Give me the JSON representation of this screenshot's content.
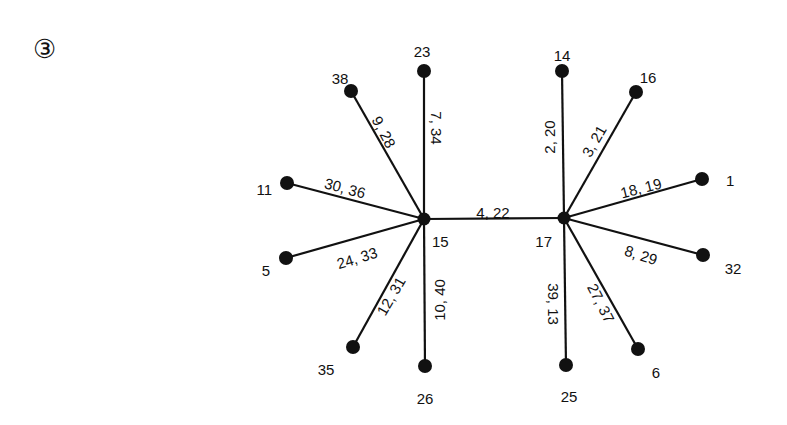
{
  "figure": {
    "marker": "③",
    "hubs": [
      "15",
      "17"
    ]
  },
  "nodes": [
    {
      "id": "15",
      "x": 424,
      "y": 219,
      "lx": 432,
      "ly": 241,
      "anchor": "start"
    },
    {
      "id": "17",
      "x": 564,
      "y": 218,
      "lx": 552,
      "ly": 241,
      "anchor": "end"
    },
    {
      "id": "23",
      "x": 424,
      "y": 71,
      "lx": 422,
      "ly": 51,
      "anchor": "middle"
    },
    {
      "id": "38",
      "x": 351,
      "y": 91,
      "lx": 340,
      "ly": 78,
      "anchor": "middle"
    },
    {
      "id": "11",
      "x": 287,
      "y": 183,
      "lx": 272,
      "ly": 189,
      "anchor": "end"
    },
    {
      "id": "5",
      "x": 286,
      "y": 258,
      "lx": 270,
      "ly": 270,
      "anchor": "end"
    },
    {
      "id": "35",
      "x": 353,
      "y": 347,
      "lx": 326,
      "ly": 369,
      "anchor": "middle"
    },
    {
      "id": "26",
      "x": 425,
      "y": 366,
      "lx": 425,
      "ly": 398,
      "anchor": "middle"
    },
    {
      "id": "14",
      "x": 562,
      "y": 71,
      "lx": 562,
      "ly": 55,
      "anchor": "middle"
    },
    {
      "id": "16",
      "x": 636,
      "y": 92,
      "lx": 648,
      "ly": 77,
      "anchor": "middle"
    },
    {
      "id": "1",
      "x": 702,
      "y": 179,
      "lx": 726,
      "ly": 180,
      "anchor": "start"
    },
    {
      "id": "32",
      "x": 703,
      "y": 255,
      "lx": 733,
      "ly": 268,
      "anchor": "middle"
    },
    {
      "id": "6",
      "x": 638,
      "y": 349,
      "lx": 656,
      "ly": 372,
      "anchor": "middle"
    },
    {
      "id": "25",
      "x": 566,
      "y": 365,
      "lx": 569,
      "ly": 396,
      "anchor": "middle"
    }
  ],
  "edges": [
    {
      "from": "15",
      "to": "17",
      "label": "4, 22",
      "tx": 493,
      "ty": 212,
      "rot": 0
    },
    {
      "from": "15",
      "to": "23",
      "label": "7, 34",
      "tx": 436,
      "ty": 128,
      "rot": 90
    },
    {
      "from": "15",
      "to": "38",
      "label": "9, 28",
      "tx": 384,
      "ty": 132,
      "rot": 62
    },
    {
      "from": "15",
      "to": "11",
      "label": "30, 36",
      "tx": 345,
      "ty": 188,
      "rot": 15
    },
    {
      "from": "15",
      "to": "5",
      "label": "24, 33",
      "tx": 357,
      "ty": 258,
      "rot": -17
    },
    {
      "from": "15",
      "to": "35",
      "label": "12, 31",
      "tx": 391,
      "ty": 296,
      "rot": -60
    },
    {
      "from": "15",
      "to": "26",
      "label": "10, 40",
      "tx": 439,
      "ty": 300,
      "rot": -90
    },
    {
      "from": "17",
      "to": "14",
      "label": "2, 20",
      "tx": 549,
      "ty": 137,
      "rot": -90
    },
    {
      "from": "17",
      "to": "16",
      "label": "3, 21",
      "tx": 594,
      "ty": 141,
      "rot": -60
    },
    {
      "from": "17",
      "to": "1",
      "label": "18, 19",
      "tx": 641,
      "ty": 188,
      "rot": -14
    },
    {
      "from": "17",
      "to": "32",
      "label": "8, 29",
      "tx": 641,
      "ty": 255,
      "rot": 18
    },
    {
      "from": "17",
      "to": "6",
      "label": "27, 37",
      "tx": 601,
      "ty": 303,
      "rot": 63
    },
    {
      "from": "17",
      "to": "25",
      "label": "39, 13",
      "tx": 553,
      "ty": 304,
      "rot": 90
    }
  ]
}
